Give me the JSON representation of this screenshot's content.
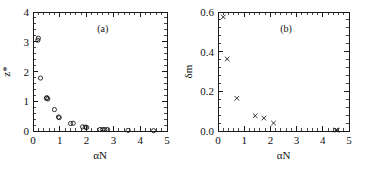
{
  "figure": {
    "background_color": "#ffffff",
    "foreground_color": "#1a1a1a",
    "panel_count": 2
  },
  "chart_data": [
    {
      "type": "scatter",
      "panel_label": "(a)",
      "title": "",
      "xlabel": "αN",
      "ylabel": "z*",
      "xlim": [
        0,
        5
      ],
      "ylim": [
        0,
        4
      ],
      "xticks": [
        0,
        1,
        2,
        3,
        4,
        5
      ],
      "xticklabels": [
        "0",
        "1",
        "2",
        "3",
        "4",
        "5"
      ],
      "yticks": [
        0,
        1,
        2,
        3,
        4
      ],
      "yticklabels": [
        "0",
        "1",
        "2",
        "3",
        "4"
      ],
      "minor_ticks": true,
      "grid": false,
      "legend": null,
      "marker": "open-circle",
      "series": [
        {
          "name": "z*",
          "x": [
            0.18,
            0.2,
            0.28,
            0.5,
            0.52,
            0.55,
            0.8,
            0.95,
            0.98,
            1.4,
            1.5,
            1.85,
            1.95,
            2.0,
            2.5,
            2.6,
            2.68,
            2.78,
            3.55,
            4.5
          ],
          "y": [
            3.05,
            3.12,
            1.78,
            1.1,
            1.12,
            1.08,
            0.72,
            0.47,
            0.45,
            0.25,
            0.26,
            0.14,
            0.13,
            0.12,
            0.05,
            0.05,
            0.05,
            0.05,
            0.02,
            0.01
          ]
        }
      ]
    },
    {
      "type": "scatter",
      "panel_label": "(b)",
      "title": "",
      "xlabel": "αN",
      "ylabel": "δm",
      "xlim": [
        0,
        5
      ],
      "ylim": [
        0.0,
        0.6
      ],
      "xticks": [
        0,
        1,
        2,
        3,
        4,
        5
      ],
      "xticklabels": [
        "0",
        "1",
        "2",
        "3",
        "4",
        "5"
      ],
      "yticks": [
        0.0,
        0.2,
        0.4,
        0.6
      ],
      "yticklabels": [
        "0.0",
        "0.2",
        "0.4",
        "0.6"
      ],
      "minor_ticks": true,
      "grid": false,
      "legend": null,
      "marker": "cross",
      "series": [
        {
          "name": "δm",
          "x": [
            0.2,
            0.35,
            0.72,
            1.42,
            1.75,
            2.12,
            4.5,
            4.55
          ],
          "y": [
            0.575,
            0.363,
            0.165,
            0.077,
            0.065,
            0.04,
            0.005,
            0.004
          ]
        }
      ]
    }
  ]
}
